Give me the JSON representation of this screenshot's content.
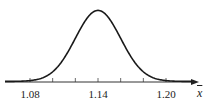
{
  "chart_data": {
    "type": "line",
    "title": "",
    "xlabel": "x̄",
    "ylabel": "",
    "mean": 1.14,
    "std_dev": 0.02,
    "x_ticks": [
      1.08,
      1.1,
      1.12,
      1.14,
      1.16,
      1.18,
      1.2
    ],
    "x_tick_labels": [
      "1.08",
      "1.14",
      "1.20"
    ],
    "labeled_tick_values": [
      1.08,
      1.14,
      1.2
    ],
    "xlim": [
      1.06,
      1.22
    ],
    "grid": false,
    "legend": null,
    "y_axis_visible": false,
    "curve_color": "#1a1a1a",
    "axis_color": "#333333"
  },
  "axis": {
    "labels": [
      "1.08",
      "1.14",
      "1.20"
    ],
    "variable": "x"
  }
}
